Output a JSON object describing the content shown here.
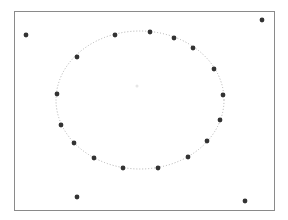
{
  "figure": {
    "frame": {
      "x": 14,
      "y": 11,
      "width": 260,
      "height": 199,
      "stroke": "#8a8a8a"
    },
    "ellipse": {
      "cx": 140,
      "cy": 100,
      "rx": 84,
      "ry": 69,
      "stroke": "#b0b0b0",
      "style": "dotted"
    },
    "center_mark": {
      "x": 137,
      "y": 86,
      "color": "#e6e6e6"
    },
    "point_color": "#333333",
    "point_radius": 2.4,
    "ellipse_points": [
      {
        "x": 115,
        "y": 35
      },
      {
        "x": 150,
        "y": 32
      },
      {
        "x": 174,
        "y": 38
      },
      {
        "x": 193,
        "y": 48
      },
      {
        "x": 214,
        "y": 69
      },
      {
        "x": 223,
        "y": 95
      },
      {
        "x": 220,
        "y": 120
      },
      {
        "x": 207,
        "y": 141
      },
      {
        "x": 188,
        "y": 157
      },
      {
        "x": 158,
        "y": 168
      },
      {
        "x": 123,
        "y": 168
      },
      {
        "x": 94,
        "y": 158
      },
      {
        "x": 74,
        "y": 143
      },
      {
        "x": 61,
        "y": 125
      },
      {
        "x": 57,
        "y": 94
      },
      {
        "x": 77,
        "y": 57
      }
    ],
    "outlier_points": [
      {
        "x": 26,
        "y": 35
      },
      {
        "x": 262,
        "y": 20
      },
      {
        "x": 77,
        "y": 197
      },
      {
        "x": 245,
        "y": 201
      }
    ]
  }
}
